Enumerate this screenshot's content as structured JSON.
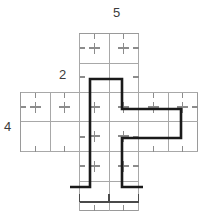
{
  "figure": {
    "kind": "geometry-diagram",
    "colors": {
      "background": "#ffffff",
      "grid_line": "#9a9a9a",
      "tick_mark": "#8c8c8c",
      "bold_outline": "#1a1a1a",
      "dimension_line": "#4a4a4a",
      "label_text": "#3b3b3b"
    },
    "grid": {
      "cell_size": 29.5,
      "origin_x": 21,
      "origin_y": 33,
      "cross_cells": [
        {
          "col": 2,
          "row": 0
        },
        {
          "col": 3,
          "row": 0
        },
        {
          "col": 0,
          "row": 1
        },
        {
          "col": 1,
          "row": 1
        },
        {
          "col": 2,
          "row": 1
        },
        {
          "col": 3,
          "row": 1
        },
        {
          "col": 4,
          "row": 1
        },
        {
          "col": 5,
          "row": 1
        },
        {
          "col": 2,
          "row": 2
        },
        {
          "col": 3,
          "row": 2
        },
        {
          "col": 2,
          "row": 3
        },
        {
          "col": 3,
          "row": 3
        }
      ]
    },
    "labels": {
      "top": "5",
      "left": "4",
      "middle": "2"
    },
    "dimension_bracket": {
      "orientation": "horizontal",
      "from_x": 79,
      "to_x": 138,
      "y": 202,
      "value": ""
    },
    "bold_polygon": {
      "closed": false,
      "points": [
        [
          70,
          187
        ],
        [
          90,
          187
        ],
        [
          90,
          79
        ],
        [
          122,
          79
        ],
        [
          122,
          109
        ],
        [
          181,
          109
        ],
        [
          181,
          138
        ],
        [
          122,
          138
        ],
        [
          122,
          187
        ],
        [
          143,
          187
        ]
      ]
    }
  }
}
